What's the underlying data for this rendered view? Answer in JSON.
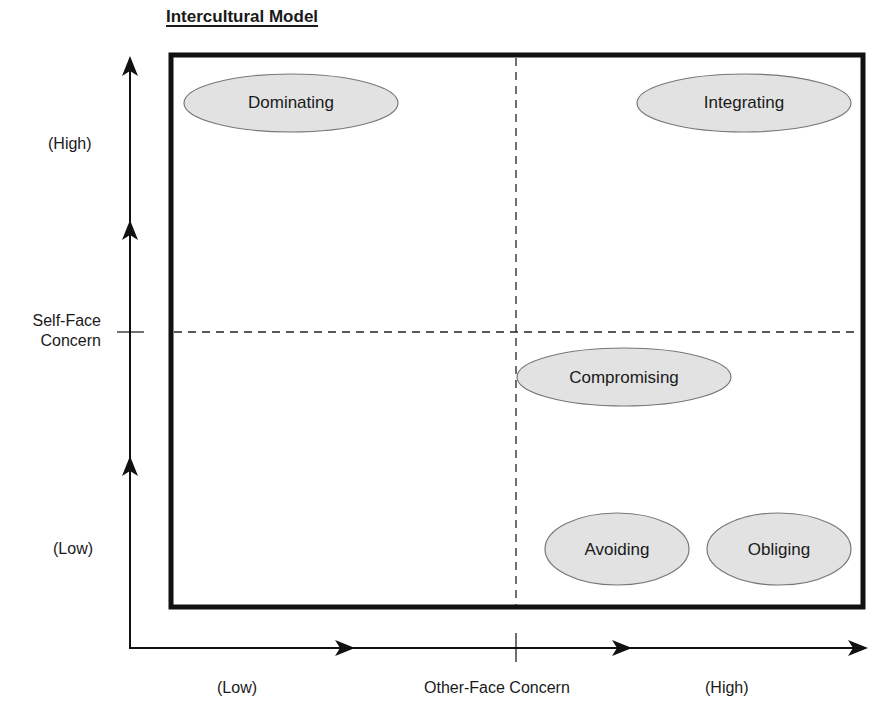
{
  "title": "Intercultural Model",
  "axes": {
    "y": {
      "label_line1": "Self-Face",
      "label_line2": "Concern",
      "high": "(High)",
      "low": "(Low)"
    },
    "x": {
      "label": "Other-Face Concern",
      "low": "(Low)",
      "high": "(High)"
    }
  },
  "styles": [
    {
      "id": "dominating",
      "label": "Dominating",
      "quadrant": "high-self / low-other"
    },
    {
      "id": "integrating",
      "label": "Integrating",
      "quadrant": "high-self / high-other"
    },
    {
      "id": "compromising",
      "label": "Compromising",
      "quadrant": "center"
    },
    {
      "id": "avoiding",
      "label": "Avoiding",
      "quadrant": "low-self / high-other"
    },
    {
      "id": "obliging",
      "label": "Obliging",
      "quadrant": "low-self / high-other"
    }
  ],
  "colors": {
    "ellipse_fill": "#e2e2e2",
    "ellipse_stroke": "#777777",
    "frame": "#111111",
    "dash": "#222222"
  }
}
